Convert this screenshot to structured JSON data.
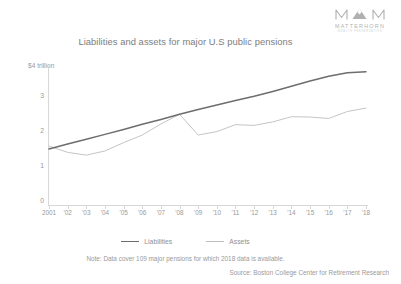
{
  "brand": {
    "mark_icon": "matterhorn-mountain-monogram",
    "name": "MATTERHORN",
    "tagline": "WEALTH PRESERVATION"
  },
  "chart_data": {
    "type": "line",
    "title": "Liabilities and assets for major U.S public pensions",
    "xlabel": "",
    "ylabel": "",
    "y_unit_label": "$4 trillion",
    "ylim": [
      0,
      4
    ],
    "yticks": [
      4,
      3,
      2,
      1,
      0
    ],
    "ytick_labels": [
      "$4 trillion",
      "3",
      "2",
      "1",
      "0"
    ],
    "grid": false,
    "legend_position": "bottom-center",
    "categories": [
      "2001",
      "'02",
      "'03",
      "'04",
      "'05",
      "'06",
      "'07",
      "'08",
      "'09",
      "'10",
      "'11",
      "'12",
      "'13",
      "'14",
      "'15",
      "'16",
      "'17",
      "'18"
    ],
    "x_tick_labels": [
      "2001",
      "'02",
      "'03",
      "'04",
      "'05",
      "'06",
      "'07",
      "'08",
      "'09",
      "'10",
      "'11",
      "'12",
      "'13",
      "'14",
      "'15",
      "'16",
      "'17",
      "'18"
    ],
    "series": [
      {
        "name": "Liabilities",
        "color": "#6d6d6d",
        "values": [
          1.62,
          1.76,
          1.9,
          2.04,
          2.18,
          2.33,
          2.47,
          2.62,
          2.76,
          2.89,
          3.02,
          3.14,
          3.28,
          3.43,
          3.58,
          3.72,
          3.82,
          3.85
        ]
      },
      {
        "name": "Assets",
        "color": "#bdbdbd",
        "values": [
          1.7,
          1.52,
          1.44,
          1.56,
          1.8,
          2.02,
          2.34,
          2.62,
          2.02,
          2.12,
          2.32,
          2.3,
          2.4,
          2.55,
          2.54,
          2.5,
          2.7,
          2.8
        ]
      }
    ],
    "note": "Note: Data cover 109 major pensions for which 2018 data is available.",
    "source": "Source: Boston College Center for Retirement Research"
  }
}
